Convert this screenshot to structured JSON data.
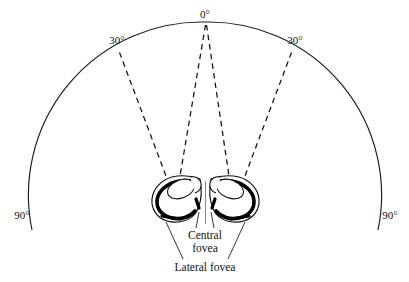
{
  "figure": {
    "type": "anatomical-visual-field-diagram",
    "background_color": "#ffffff",
    "line_color": "#111111",
    "axis_labels": {
      "top_center": "0°",
      "left_thirty": "30°",
      "right_thirty": "30°",
      "left_ninety": "90°",
      "right_ninety": "90°"
    },
    "annotations": {
      "central_fovea_line1": "Central",
      "central_fovea_line2": "fovea",
      "lateral_fovea": "Lateral fovea"
    },
    "arc": {
      "center_x": 205,
      "center_y": 232,
      "radius": 173,
      "start_angle_deg": -90,
      "end_angle_deg": 90,
      "stroke_width": 1.15
    },
    "sight_lines": [
      {
        "name": "left-lateral-sight-line",
        "from_deg": -30,
        "style": "dashed"
      },
      {
        "name": "left-central-sight-line",
        "from_deg": 0,
        "style": "dashed"
      },
      {
        "name": "right-central-sight-line",
        "from_deg": 0,
        "style": "dashed"
      },
      {
        "name": "right-lateral-sight-line",
        "from_deg": 30,
        "style": "dashed"
      }
    ],
    "eyes": [
      {
        "name": "left-eye",
        "side": "left"
      },
      {
        "name": "right-eye",
        "side": "right"
      }
    ]
  }
}
